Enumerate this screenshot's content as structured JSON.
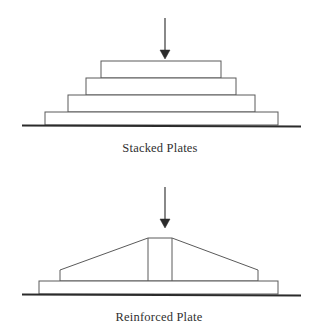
{
  "figure": {
    "background_color": "#ffffff",
    "line_color": "#5a5a5a",
    "ground_color": "#2b2b2b",
    "arrow_color": "#2b2b2b",
    "text_color": "#2f2f2f"
  },
  "panels": [
    {
      "id": "stacked-plates",
      "caption": "Stacked Plates",
      "caption_x": 160,
      "caption_y": 152,
      "load_arrow": {
        "name": "load-arrow",
        "x": 165,
        "shaft_top_y": 18,
        "shaft_bottom_y": 50,
        "tip_y": 59,
        "head_half_width": 5
      },
      "ground": {
        "x1": 22,
        "x2": 301,
        "y": 125
      },
      "plates": [
        {
          "label": "plate-layer-1-top",
          "x": 101,
          "y": 61,
          "width": 120,
          "height": 17
        },
        {
          "label": "plate-layer-2",
          "x": 86,
          "y": 78,
          "width": 150,
          "height": 17
        },
        {
          "label": "plate-layer-3",
          "x": 68,
          "y": 95,
          "width": 187,
          "height": 17
        },
        {
          "label": "plate-layer-4-bottom",
          "x": 45,
          "y": 112,
          "width": 233,
          "height": 13
        }
      ]
    },
    {
      "id": "reinforced-plate",
      "caption": "Reinforced Plate",
      "caption_x": 159,
      "caption_y": 321,
      "load_arrow": {
        "name": "load-arrow",
        "x": 165,
        "shaft_top_y": 187,
        "shaft_bottom_y": 219,
        "tip_y": 228,
        "head_half_width": 5
      },
      "ground": {
        "x1": 22,
        "x2": 301,
        "y": 294
      },
      "base_plate": {
        "label": "base-plate",
        "x": 39,
        "y": 281,
        "width": 239,
        "height": 13
      },
      "rib_profile": {
        "label": "reinforcement-profile",
        "points": "60,281 60,270 148,238 172,238 258,270 258,281"
      },
      "center_rib": {
        "label": "center-rib",
        "left_x": 148,
        "right_x": 172,
        "top_y": 238,
        "bottom_y": 281
      }
    }
  ]
}
